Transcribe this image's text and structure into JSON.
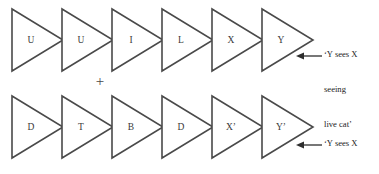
{
  "figure": {
    "background_color": "#ffffff",
    "outline_color": "#4a4a4a",
    "text_color": "#232323",
    "operator": "+",
    "rows": [
      {
        "id": "top-row",
        "labels": [
          "U",
          "U",
          "I",
          "L",
          "X",
          "Y"
        ],
        "annotation": {
          "lines": [
            "‘Y sees X",
            "seeing",
            "live cat’"
          ],
          "arrow": "left-arrow-icon"
        }
      },
      {
        "id": "bottom-row",
        "labels": [
          "D",
          "T",
          "B",
          "D",
          "X’",
          "Y’"
        ],
        "annotation": {
          "lines": [
            "‘Y sees X",
            "seeing",
            "dead cat’"
          ],
          "arrow": "left-arrow-icon"
        }
      }
    ]
  },
  "geometry": {
    "triangle_pitch": 50,
    "triangle_width": 51,
    "triangle_height": 62,
    "top_row_y": 9,
    "bottom_row_y": 96,
    "first_x": 12
  }
}
